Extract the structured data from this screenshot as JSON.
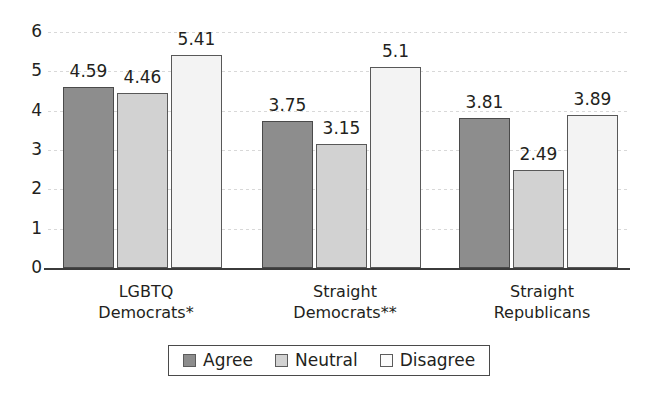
{
  "chart_data": {
    "type": "bar",
    "title": "",
    "subtitle": "",
    "xlabel": "",
    "ylabel": "",
    "ylim": [
      0,
      6
    ],
    "ytick_labels": [
      "0",
      "1",
      "2",
      "3",
      "4",
      "5",
      "6"
    ],
    "grid": true,
    "legend_position": "bottom",
    "categories": [
      "LGBTQ Democrats*",
      "Straight Democrats**",
      "Straight Republicans"
    ],
    "category_lines": [
      [
        "LGBTQ",
        "Democrats*"
      ],
      [
        "Straight",
        "Democrats**"
      ],
      [
        "Straight",
        "Republicans"
      ]
    ],
    "series": [
      {
        "name": "Agree",
        "color": "#8d8d8d",
        "values": [
          4.59,
          3.75,
          3.81
        ],
        "labels": [
          "4.59",
          "3.75",
          "3.81"
        ]
      },
      {
        "name": "Neutral",
        "color": "#d2d2d2",
        "values": [
          4.46,
          3.15,
          2.49
        ],
        "labels": [
          "4.46",
          "3.15",
          "2.49"
        ]
      },
      {
        "name": "Disagree",
        "color": "#f3f3f3",
        "values": [
          5.41,
          5.1,
          3.89
        ],
        "labels": [
          "5.41",
          "5.1",
          "3.89"
        ]
      }
    ],
    "legend_entries": [
      "Agree",
      "Neutral",
      "Disagree"
    ]
  },
  "colors": {
    "agree": "#8d8d8d",
    "neutral": "#d2d2d2",
    "disagree": "#f3f3f3",
    "axis": "#3b3b3b",
    "grid": "#d8d8d8",
    "text": "#231f20"
  }
}
